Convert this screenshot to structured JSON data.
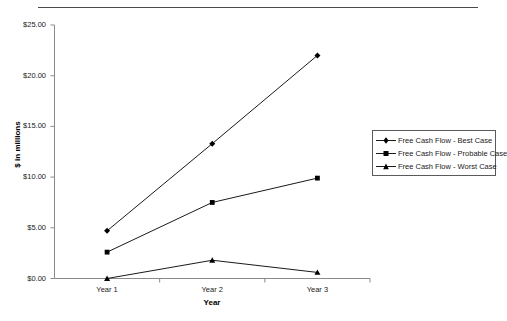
{
  "chart_data": {
    "type": "line",
    "title": "",
    "xlabel": "Year",
    "ylabel": "$ in millions",
    "categories": [
      "Year 1",
      "Year 2",
      "Year 3"
    ],
    "ylim": [
      0,
      25
    ],
    "ytick_values": [
      0,
      5,
      10,
      15,
      20,
      25
    ],
    "ytick_labels": [
      "$0.00",
      "$5.00",
      "$10.00",
      "$15.00",
      "$20.00",
      "$25.00"
    ],
    "grid": false,
    "legend_position": "right",
    "series": [
      {
        "name": "Free Cash Flow - Best Case",
        "marker": "diamond",
        "color": "#000000",
        "values": [
          4.7,
          13.3,
          22.0
        ]
      },
      {
        "name": "Free Cash Flow - Probable Case",
        "marker": "square",
        "color": "#000000",
        "values": [
          2.6,
          7.5,
          9.9
        ]
      },
      {
        "name": "Free Cash Flow - Worst Case",
        "marker": "triangle",
        "color": "#000000",
        "values": [
          0.0,
          1.8,
          0.6
        ]
      }
    ]
  },
  "legend": {
    "entries": [
      {
        "label": "Free Cash Flow - Best Case"
      },
      {
        "label": "Free Cash Flow - Probable Case"
      },
      {
        "label": "Free Cash Flow - Worst Case"
      }
    ]
  },
  "axes": {
    "x_title": "Year",
    "y_title": "$ in millions"
  },
  "colors": {
    "series_line": "#000000",
    "axis": "#808080",
    "top_rule": "#4a4a4a",
    "background": "#ffffff"
  }
}
